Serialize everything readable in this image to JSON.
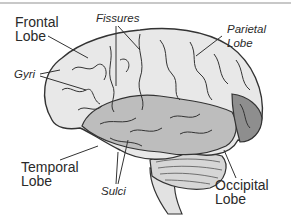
{
  "diagram": {
    "labels": {
      "frontal": "Frontal\nLobe",
      "fissures": "Fissures",
      "parietal": "Parietal\nLobe",
      "gyri": "Gyri",
      "temporal": "Temporal\nLobe",
      "sulci": "Sulci",
      "occipital": "Occipital\nLobe"
    },
    "colors": {
      "outline": "#333333",
      "cerebrum_fill": "#e8e8e8",
      "temporal_fill": "#bdbdbd",
      "occipital_fill": "#8e8e8e",
      "cerebellum_fill": "#d6d6d6",
      "text": "#2a2a2a",
      "top_border": "#c8c8c8"
    }
  }
}
